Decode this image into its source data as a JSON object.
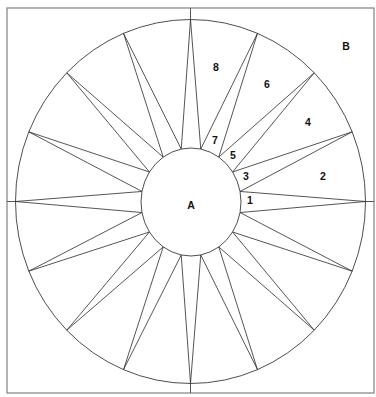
{
  "diagram": {
    "type": "quilt-pattern-template",
    "frame": {
      "x": 7,
      "y": 8,
      "width": 367,
      "height": 385
    },
    "center": {
      "x": 190.5,
      "y": 201.5
    },
    "outer_circle": {
      "rx": 175,
      "ry": 182
    },
    "inner_circle": {
      "cx": 191,
      "cy": 202,
      "rx": 50,
      "ry": 54
    },
    "star_points": 16,
    "star_tip_start_angle_deg": 90,
    "star_base_offset_deg": 11.25,
    "colors": {
      "stroke": "#2a2a2a",
      "frame": "#8a8a8a",
      "label": "#111111",
      "background": "#ffffff"
    },
    "labels": [
      {
        "id": "A",
        "text": "A",
        "x": 191,
        "y": 205,
        "region": "center-circle"
      },
      {
        "id": "B",
        "text": "B",
        "x": 346,
        "y": 46,
        "region": "corner-background"
      },
      {
        "id": "1",
        "text": "1",
        "x": 250,
        "y": 200,
        "region": "star-point"
      },
      {
        "id": "2",
        "text": "2",
        "x": 323,
        "y": 176,
        "region": "background-wedge"
      },
      {
        "id": "3",
        "text": "3",
        "x": 246,
        "y": 176,
        "region": "star-point"
      },
      {
        "id": "4",
        "text": "4",
        "x": 308,
        "y": 122,
        "region": "background-wedge"
      },
      {
        "id": "5",
        "text": "5",
        "x": 233,
        "y": 155,
        "region": "star-point"
      },
      {
        "id": "6",
        "text": "6",
        "x": 267,
        "y": 84,
        "region": "background-wedge"
      },
      {
        "id": "7",
        "text": "7",
        "x": 215,
        "y": 140,
        "region": "star-point"
      },
      {
        "id": "8",
        "text": "8",
        "x": 216,
        "y": 67,
        "region": "background-wedge"
      }
    ]
  }
}
